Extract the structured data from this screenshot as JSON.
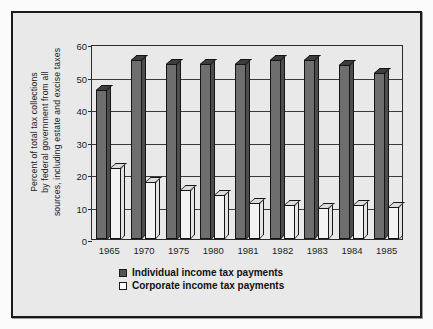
{
  "chart_data": {
    "type": "bar",
    "title": "",
    "xlabel": "",
    "ylabel": "Percent of total tax collections by federal government from all sources, including estate and excise taxes",
    "ylabel_lines": [
      "Percent of total tax collections",
      "by federal government from all",
      "sources, including estate and excise taxes"
    ],
    "categories": [
      "1965",
      "1970",
      "1975",
      "1980",
      "1981",
      "1982",
      "1983",
      "1984",
      "1985"
    ],
    "series": [
      {
        "name": "Individual income tax payments",
        "color": "#6e6e6e",
        "values": [
          46,
          55,
          54,
          54,
          54,
          55,
          55,
          53.5,
          51
        ]
      },
      {
        "name": "Corporate income tax payments",
        "color": "#f3f3f3",
        "values": [
          22,
          17.5,
          15,
          13.5,
          11,
          10.5,
          9.5,
          10.5,
          10
        ]
      }
    ],
    "ylim": [
      0,
      60
    ],
    "yticks": [
      0,
      10,
      20,
      30,
      40,
      50,
      60
    ],
    "ytick_labels": [
      "0",
      "10",
      "20",
      "30",
      "40",
      "50",
      "60"
    ],
    "grid": true,
    "legend_position": "bottom-center"
  },
  "legend": {
    "items": [
      {
        "label": "Individual income tax payments",
        "swatch": "dark"
      },
      {
        "label": "Corporate income tax payments",
        "swatch": "light"
      }
    ]
  }
}
